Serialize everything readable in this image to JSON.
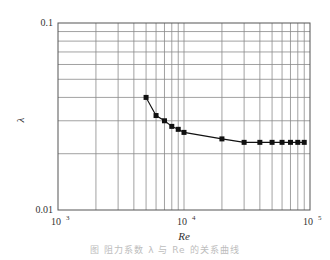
{
  "chart_data": {
    "type": "line",
    "title": "",
    "xlabel": "Re",
    "ylabel": "λ",
    "xscale": "log",
    "yscale": "log",
    "xlim": [
      1000,
      100000
    ],
    "ylim": [
      0.01,
      0.1
    ],
    "grid": true,
    "legend": null,
    "x_tick_labels": [
      {
        "base": "10",
        "exp": "3",
        "value": 1000
      },
      {
        "base": "10",
        "exp": "4",
        "value": 10000
      },
      {
        "base": "10",
        "exp": "5",
        "value": 100000
      }
    ],
    "y_tick_labels": [
      {
        "label": "0.1",
        "value": 0.1
      },
      {
        "label": "0.01",
        "value": 0.01
      }
    ],
    "series": [
      {
        "name": "λ",
        "marker": "square",
        "color": "#111111",
        "x": [
          5000,
          6000,
          7000,
          8000,
          9000,
          10000,
          20000,
          30000,
          40000,
          50000,
          60000,
          70000,
          80000,
          90000
        ],
        "y": [
          0.04,
          0.032,
          0.03,
          0.028,
          0.027,
          0.026,
          0.024,
          0.023,
          0.023,
          0.023,
          0.023,
          0.023,
          0.023,
          0.023
        ]
      }
    ]
  },
  "caption": "图  阻力系数 λ 与 Re 的关系曲线"
}
